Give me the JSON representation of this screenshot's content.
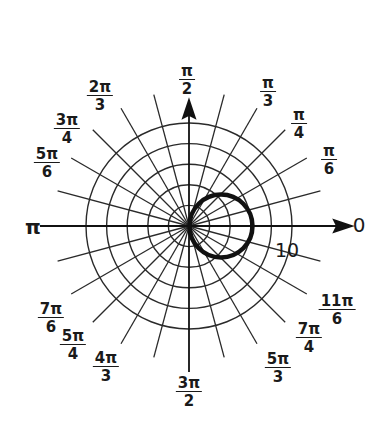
{
  "chart_data": {
    "type": "polar",
    "title": "",
    "radial_axis": {
      "max": 10,
      "circles": [
        2,
        4,
        6,
        8,
        10
      ],
      "label": "10"
    },
    "angular_axis": {
      "spoke_step_deg": 15,
      "tick_labels": [
        {
          "angle": "0",
          "text": "0"
        },
        {
          "angle": "pi/6",
          "num": "π",
          "den": "6"
        },
        {
          "angle": "pi/4",
          "num": "π",
          "den": "4"
        },
        {
          "angle": "pi/3",
          "num": "π",
          "den": "3"
        },
        {
          "angle": "pi/2",
          "num": "π",
          "den": "2"
        },
        {
          "angle": "2pi/3",
          "num": "2π",
          "den": "3"
        },
        {
          "angle": "3pi/4",
          "num": "3π",
          "den": "4"
        },
        {
          "angle": "5pi/6",
          "num": "5π",
          "den": "6"
        },
        {
          "angle": "pi",
          "text": "π"
        },
        {
          "angle": "7pi/6",
          "num": "7π",
          "den": "6"
        },
        {
          "angle": "5pi/4",
          "num": "5π",
          "den": "4"
        },
        {
          "angle": "4pi/3",
          "num": "4π",
          "den": "3"
        },
        {
          "angle": "3pi/2",
          "num": "3π",
          "den": "2"
        },
        {
          "angle": "5pi/3",
          "num": "5π",
          "den": "3"
        },
        {
          "angle": "7pi/4",
          "num": "7π",
          "den": "4"
        },
        {
          "angle": "11pi/6",
          "num": "11π",
          "den": "6"
        }
      ]
    },
    "series": [
      {
        "name": "r = 6cos(theta)",
        "kind": "circle",
        "diameter": 6,
        "center_polar": [
          3,
          0
        ],
        "color": "#111111"
      }
    ],
    "grid": true,
    "legend": null
  },
  "labels": {
    "zero": "0",
    "pi": "π",
    "ten": "10",
    "pi_2": {
      "num": "π",
      "den": "2"
    },
    "pi_3": {
      "num": "π",
      "den": "3"
    },
    "pi_4": {
      "num": "π",
      "den": "4"
    },
    "pi_6": {
      "num": "π",
      "den": "6"
    },
    "p2pi_3": {
      "num": "2π",
      "den": "3"
    },
    "p3pi_4": {
      "num": "3π",
      "den": "4"
    },
    "p5pi_6": {
      "num": "5π",
      "den": "6"
    },
    "p7pi_6": {
      "num": "7π",
      "den": "6"
    },
    "p5pi_4": {
      "num": "5π",
      "den": "4"
    },
    "p4pi_3": {
      "num": "4π",
      "den": "3"
    },
    "p3pi_2": {
      "num": "3π",
      "den": "2"
    },
    "p5pi_3": {
      "num": "5π",
      "den": "3"
    },
    "p7pi_4": {
      "num": "7π",
      "den": "4"
    },
    "p11pi_6": {
      "num": "11π",
      "den": "6"
    }
  },
  "colors": {
    "ink": "#1a1a1a",
    "grid": "#2a2a2a",
    "background": "#ffffff"
  }
}
